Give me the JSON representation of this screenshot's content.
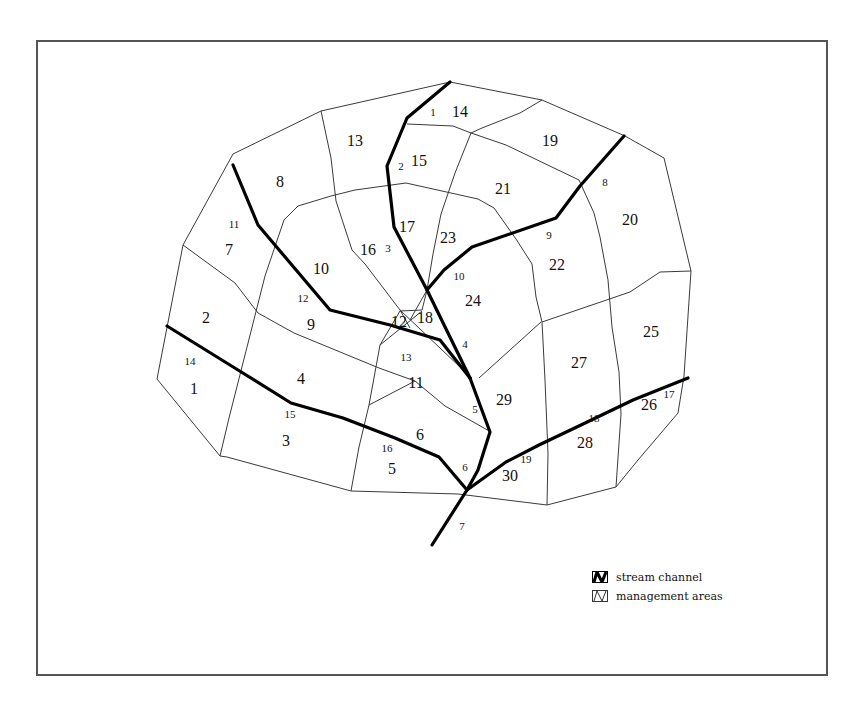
{
  "legend": {
    "items": [
      {
        "key": "stream",
        "label": "stream channel"
      },
      {
        "key": "areas",
        "label": "management areas"
      }
    ]
  },
  "diagram": {
    "outline": [
      [
        450,
        82
      ],
      [
        542,
        100
      ],
      [
        625,
        136
      ],
      [
        664,
        158
      ],
      [
        691,
        271
      ],
      [
        684,
        376
      ],
      [
        678,
        413
      ],
      [
        638,
        460
      ],
      [
        616,
        487
      ],
      [
        547,
        505
      ],
      [
        458,
        494
      ],
      [
        351,
        491
      ],
      [
        227,
        457
      ],
      [
        220,
        456
      ],
      [
        157,
        379
      ],
      [
        183,
        245
      ],
      [
        233,
        154
      ],
      [
        321,
        111
      ],
      [
        450,
        82
      ]
    ],
    "area_lines": [
      [
        [
          407,
          124
        ],
        [
          453,
          126
        ],
        [
          471,
          133
        ],
        [
          506,
          145
        ],
        [
          579,
          180
        ]
      ],
      [
        [
          471,
          133
        ],
        [
          482,
          128
        ],
        [
          520,
          113
        ],
        [
          542,
          100
        ]
      ],
      [
        [
          321,
          111
        ],
        [
          331,
          158
        ],
        [
          336,
          201
        ],
        [
          352,
          250
        ],
        [
          365,
          264
        ],
        [
          400,
          310
        ],
        [
          461,
          368
        ]
      ],
      [
        [
          298,
          206
        ],
        [
          331,
          196
        ],
        [
          355,
          190
        ],
        [
          406,
          183
        ],
        [
          478,
          199
        ],
        [
          494,
          208
        ]
      ],
      [
        [
          298,
          206
        ],
        [
          284,
          220
        ],
        [
          265,
          276
        ],
        [
          246,
          351
        ],
        [
          229,
          418
        ],
        [
          220,
          456
        ]
      ],
      [
        [
          183,
          245
        ],
        [
          235,
          283
        ],
        [
          258,
          313
        ],
        [
          294,
          333
        ],
        [
          379,
          368
        ],
        [
          415,
          381
        ]
      ],
      [
        [
          494,
          208
        ],
        [
          516,
          239
        ],
        [
          532,
          264
        ],
        [
          536,
          297
        ],
        [
          542,
          322
        ],
        [
          545,
          380
        ],
        [
          548,
          454
        ],
        [
          547,
          505
        ]
      ],
      [
        [
          579,
          180
        ],
        [
          594,
          213
        ],
        [
          600,
          237
        ],
        [
          608,
          280
        ],
        [
          612,
          327
        ],
        [
          619,
          372
        ],
        [
          621,
          414
        ],
        [
          616,
          487
        ]
      ],
      [
        [
          660,
          272
        ],
        [
          691,
          271
        ]
      ],
      [
        [
          542,
          322
        ],
        [
          630,
          292
        ],
        [
          660,
          272
        ]
      ],
      [
        [
          479,
          378
        ],
        [
          541,
          322
        ]
      ],
      [
        [
          471,
          133
        ],
        [
          455,
          173
        ],
        [
          441,
          214
        ],
        [
          433,
          254
        ],
        [
          427,
          290
        ],
        [
          422,
          310
        ],
        [
          400,
          311
        ],
        [
          380,
          345
        ],
        [
          369,
          405
        ],
        [
          359,
          447
        ],
        [
          351,
          491
        ]
      ],
      [
        [
          369,
          405
        ],
        [
          415,
          381
        ],
        [
          445,
          406
        ],
        [
          491,
          432
        ]
      ],
      [
        [
          427,
          290
        ],
        [
          410,
          320
        ]
      ],
      [
        [
          380,
          345
        ],
        [
          422,
          311
        ]
      ],
      [
        [
          400,
          310
        ],
        [
          410,
          328
        ]
      ]
    ],
    "stream_lines": [
      [
        [
          450,
          82
        ],
        [
          407,
          118
        ],
        [
          387,
          166
        ],
        [
          394,
          227
        ],
        [
          427,
          290
        ],
        [
          470,
          378
        ]
      ],
      [
        [
          233,
          165
        ],
        [
          258,
          225
        ],
        [
          330,
          310
        ],
        [
          390,
          325
        ],
        [
          440,
          340
        ],
        [
          470,
          378
        ]
      ],
      [
        [
          624,
          136
        ],
        [
          580,
          186
        ],
        [
          556,
          218
        ],
        [
          472,
          247
        ],
        [
          444,
          270
        ],
        [
          427,
          290
        ]
      ],
      [
        [
          167,
          326
        ],
        [
          238,
          370
        ],
        [
          291,
          403
        ],
        [
          343,
          418
        ],
        [
          395,
          438
        ],
        [
          439,
          457
        ],
        [
          467,
          490
        ]
      ],
      [
        [
          470,
          378
        ],
        [
          490,
          432
        ],
        [
          478,
          470
        ],
        [
          467,
          490
        ]
      ],
      [
        [
          467,
          490
        ],
        [
          506,
          462
        ],
        [
          539,
          445
        ],
        [
          581,
          425
        ],
        [
          633,
          400
        ],
        [
          688,
          378
        ]
      ],
      [
        [
          467,
          490
        ],
        [
          432,
          545
        ]
      ]
    ],
    "area_labels": [
      {
        "text": "1",
        "x": 194,
        "y": 394
      },
      {
        "text": "2",
        "x": 206,
        "y": 323
      },
      {
        "text": "3",
        "x": 286,
        "y": 446
      },
      {
        "text": "4",
        "x": 301,
        "y": 384
      },
      {
        "text": "5",
        "x": 392,
        "y": 474
      },
      {
        "text": "6",
        "x": 420,
        "y": 440
      },
      {
        "text": "7",
        "x": 229,
        "y": 255
      },
      {
        "text": "8",
        "x": 280,
        "y": 187
      },
      {
        "text": "9",
        "x": 311,
        "y": 330
      },
      {
        "text": "10",
        "x": 321,
        "y": 274
      },
      {
        "text": "11",
        "x": 416,
        "y": 388
      },
      {
        "text": "12",
        "x": 399,
        "y": 327
      },
      {
        "text": "13",
        "x": 355,
        "y": 146
      },
      {
        "text": "14",
        "x": 460,
        "y": 117
      },
      {
        "text": "15",
        "x": 419,
        "y": 166
      },
      {
        "text": "16",
        "x": 368,
        "y": 255
      },
      {
        "text": "17",
        "x": 407,
        "y": 232
      },
      {
        "text": "18",
        "x": 425,
        "y": 323
      },
      {
        "text": "19",
        "x": 550,
        "y": 146
      },
      {
        "text": "20",
        "x": 630,
        "y": 225
      },
      {
        "text": "21",
        "x": 503,
        "y": 194
      },
      {
        "text": "22",
        "x": 557,
        "y": 270
      },
      {
        "text": "23",
        "x": 448,
        "y": 243
      },
      {
        "text": "24",
        "x": 473,
        "y": 306
      },
      {
        "text": "25",
        "x": 651,
        "y": 337
      },
      {
        "text": "26",
        "x": 649,
        "y": 410
      },
      {
        "text": "27",
        "x": 579,
        "y": 368
      },
      {
        "text": "28",
        "x": 585,
        "y": 448
      },
      {
        "text": "29",
        "x": 504,
        "y": 405
      },
      {
        "text": "30",
        "x": 510,
        "y": 481
      }
    ],
    "stream_labels": [
      {
        "text": "1",
        "x": 433,
        "y": 116
      },
      {
        "text": "2",
        "x": 401,
        "y": 170
      },
      {
        "text": "3",
        "x": 388,
        "y": 252
      },
      {
        "text": "4",
        "x": 465,
        "y": 348
      },
      {
        "text": "5",
        "x": 475,
        "y": 413
      },
      {
        "text": "6",
        "x": 465,
        "y": 471
      },
      {
        "text": "7",
        "x": 462,
        "y": 530
      },
      {
        "text": "8",
        "x": 605,
        "y": 186
      },
      {
        "text": "9",
        "x": 549,
        "y": 239
      },
      {
        "text": "10",
        "x": 459,
        "y": 280
      },
      {
        "text": "11",
        "x": 234,
        "y": 228
      },
      {
        "text": "12",
        "x": 303,
        "y": 302
      },
      {
        "text": "13",
        "x": 406,
        "y": 361
      },
      {
        "text": "14",
        "x": 190,
        "y": 365
      },
      {
        "text": "15",
        "x": 290,
        "y": 418
      },
      {
        "text": "16",
        "x": 387,
        "y": 452
      },
      {
        "text": "17",
        "x": 669,
        "y": 398
      },
      {
        "text": "18",
        "x": 594,
        "y": 422
      },
      {
        "text": "19",
        "x": 526,
        "y": 463
      }
    ]
  }
}
